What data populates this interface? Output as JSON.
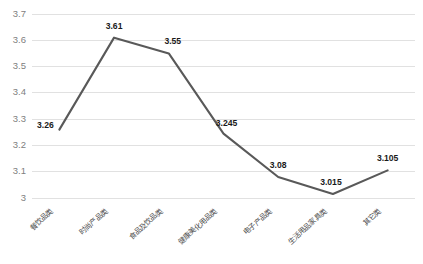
{
  "chart_data": {
    "type": "line",
    "title": "",
    "xlabel": "",
    "ylabel": "",
    "categories": [
      "餐饮品类",
      "时尚产品类",
      "食品及饮品类",
      "健康美化用品类",
      "电子产品类",
      "生活用品家具类",
      "其它类"
    ],
    "values": [
      3.26,
      3.61,
      3.55,
      3.245,
      3.08,
      3.015,
      3.105
    ],
    "point_labels": [
      "3.26",
      "3.61",
      "3.55",
      "3.245",
      "3.08",
      "3.015",
      "3.105"
    ],
    "ylim": [
      3,
      3.7
    ],
    "ytick_labels": [
      "3",
      "3.1",
      "3.2",
      "3.3",
      "3.4",
      "3.5",
      "3.6",
      "3.7"
    ],
    "ytick_values": [
      3,
      3.1,
      3.2,
      3.3,
      3.4,
      3.5,
      3.6,
      3.7
    ],
    "grid": true,
    "legend": "none",
    "series": [
      {
        "name": "",
        "values": [
          3.26,
          3.61,
          3.55,
          3.245,
          3.08,
          3.015,
          3.105
        ]
      }
    ],
    "colors": {
      "line": "#595959",
      "gridline": "#d9d9d9",
      "tick_text": "#808080",
      "data_label_text": "#1a1a1a",
      "background": "#ffffff"
    }
  }
}
